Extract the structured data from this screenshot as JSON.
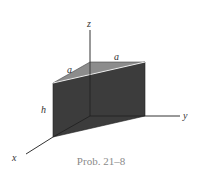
{
  "diagram": {
    "axes": {
      "x_label": "x",
      "y_label": "y",
      "z_label": "z"
    },
    "dimensions": {
      "top_left_edge": "a",
      "top_right_edge": "a",
      "height": "h"
    },
    "caption": "Prob. 21–8",
    "colors": {
      "front_face": "#3a3a3a",
      "right_face": "#2e2e2e",
      "top_face": "#8c8c8c",
      "edge_highlight": "#e8e8e8",
      "axis": "#333333"
    }
  }
}
